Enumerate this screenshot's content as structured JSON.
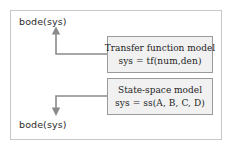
{
  "figure": {
    "border_color": "#c8c8c8",
    "background": "#ffffff"
  },
  "nodes": {
    "top_label": "bode(sys)",
    "bottom_label": "bode(sys)"
  },
  "boxes": [
    {
      "id": "transfer-function",
      "line1": "Transfer function model",
      "line2": "sys = tf(num,den)",
      "fill": "#f1f1f1",
      "border": "#9a9a9a"
    },
    {
      "id": "state-space",
      "line1": "State-space model",
      "line2": "sys = ss(A, B, C, D)",
      "fill": "#f1f1f1",
      "border": "#9a9a9a"
    }
  ],
  "connectors": [
    {
      "id": "tf-to-bode-top",
      "direction": "up",
      "from": "transfer-function",
      "to": "top_label",
      "color": "#8a8a8a"
    },
    {
      "id": "ss-to-bode-bottom",
      "direction": "down",
      "from": "state-space",
      "to": "bottom_label",
      "color": "#8a8a8a"
    }
  ]
}
